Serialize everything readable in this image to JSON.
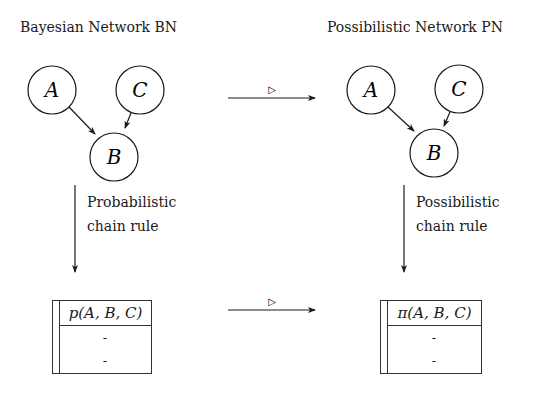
{
  "left": {
    "title": "Bayesian Network BN",
    "nodes": [
      "A",
      "C",
      "B"
    ],
    "transition_label_line1": "Probabilistic",
    "transition_label_line2": "chain rule",
    "table": {
      "header": "p(A, B, C)",
      "rows": [
        "-",
        "-"
      ]
    }
  },
  "right": {
    "title": "Possibilistic Network PN",
    "nodes": [
      "A",
      "C",
      "B"
    ],
    "transition_label_line1": "Possibilistic",
    "transition_label_line2": "chain rule",
    "table": {
      "header": "π(A, B, C)",
      "rows": [
        "-",
        "-"
      ]
    }
  },
  "mapping_arrows": {
    "top_label": "▷",
    "bottom_label": "▷"
  }
}
